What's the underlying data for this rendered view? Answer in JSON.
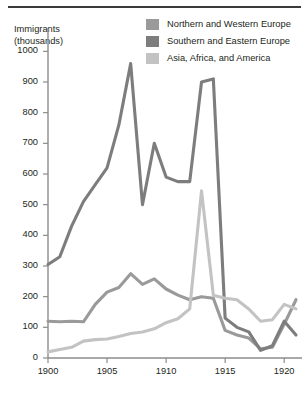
{
  "figure": {
    "y_axis_title_line1": "Immigrants",
    "y_axis_title_line2": "(thousands)"
  },
  "legend": {
    "items": [
      {
        "label": "Northern and Western Europe",
        "color": "#9a9a9a",
        "swatch_name": "legend-swatch-northern-western-europe"
      },
      {
        "label": "Southern and Eastern Europe",
        "color": "#7d7d7d",
        "swatch_name": "legend-swatch-southern-eastern-europe"
      },
      {
        "label": "Asia, Africa, and America",
        "color": "#c3c3c3",
        "swatch_name": "legend-swatch-asia-africa-america"
      }
    ]
  },
  "chart_data": {
    "type": "line",
    "title": "",
    "xlabel": "",
    "ylabel": "Immigrants (thousands)",
    "xlim": [
      1900,
      1921
    ],
    "ylim": [
      0,
      1050
    ],
    "yticks": [
      0,
      100,
      200,
      300,
      400,
      500,
      600,
      700,
      800,
      900,
      1000
    ],
    "ytick_labels": [
      "0",
      "100",
      "200",
      "300",
      "400",
      "500",
      "600",
      "700",
      "800",
      "900",
      "1000"
    ],
    "xticks": [
      1900,
      1905,
      1910,
      1915,
      1920
    ],
    "xtick_labels": [
      "1900",
      "1905",
      "1910",
      "1915",
      "1920"
    ],
    "grid": false,
    "legend_position": "top-right",
    "x": [
      1900,
      1901,
      1902,
      1903,
      1904,
      1905,
      1906,
      1907,
      1908,
      1909,
      1910,
      1911,
      1912,
      1913,
      1914,
      1915,
      1916,
      1917,
      1918,
      1919,
      1920,
      1921
    ],
    "series": [
      {
        "name": "Northern and Western Europe",
        "color": "#9a9a9a",
        "values": [
          120,
          118,
          120,
          118,
          175,
          215,
          230,
          275,
          240,
          258,
          225,
          205,
          190,
          200,
          195,
          90,
          75,
          65,
          30,
          35,
          110,
          190
        ]
      },
      {
        "name": "Southern and Eastern Europe",
        "color": "#7d7d7d",
        "values": [
          305,
          330,
          430,
          510,
          565,
          620,
          760,
          960,
          500,
          700,
          590,
          575,
          575,
          900,
          910,
          130,
          100,
          85,
          25,
          40,
          120,
          75
        ]
      },
      {
        "name": "Asia, Africa, and America",
        "color": "#c3c3c3",
        "values": [
          20,
          28,
          35,
          55,
          60,
          62,
          70,
          80,
          85,
          95,
          115,
          128,
          160,
          545,
          205,
          195,
          190,
          160,
          120,
          125,
          175,
          160
        ]
      }
    ]
  }
}
